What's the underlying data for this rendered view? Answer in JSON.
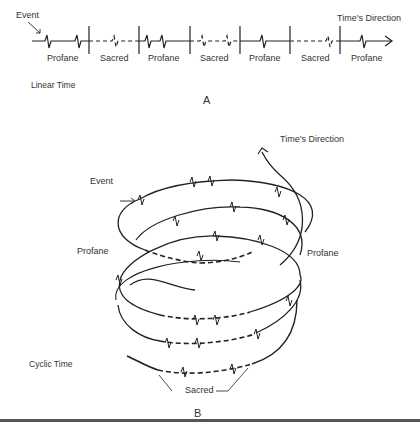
{
  "panel_a": {
    "event_label": "Event",
    "direction_label": "Time's Direction",
    "segments": [
      {
        "label": "Profane",
        "style": "solid"
      },
      {
        "label": "Sacred",
        "style": "dashed"
      },
      {
        "label": "Profane",
        "style": "solid"
      },
      {
        "label": "Sacred",
        "style": "dashed"
      },
      {
        "label": "Profane",
        "style": "solid"
      },
      {
        "label": "Profane",
        "style": "solid"
      },
      {
        "label": "Sacred",
        "style": "dashed"
      },
      {
        "label": "Profane",
        "style": "solid"
      }
    ],
    "caption": "Linear Time",
    "panel_letter": "A"
  },
  "panel_b": {
    "direction_label": "Time's Direction",
    "event_label": "Event",
    "left_label": "Profane",
    "right_label": "Profane",
    "sacred_label": "Sacred",
    "caption": "Cyclic Time",
    "panel_letter": "B"
  },
  "colors": {
    "line": "#222222",
    "text": "#333333",
    "rule": "#555555"
  }
}
